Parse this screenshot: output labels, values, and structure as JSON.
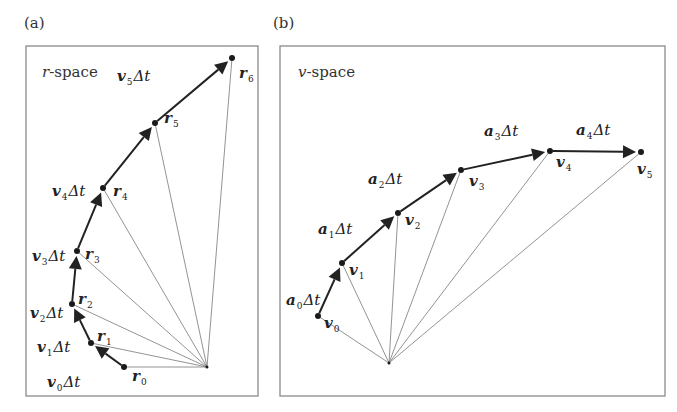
{
  "panels": [
    {
      "id": "a",
      "label": "(a)",
      "space_label_var": "r",
      "space_label_rest": "-space",
      "point_symbol": "r",
      "step_symbol": "v",
      "step_suffix": "Δt",
      "points": [
        {
          "name": "r",
          "index": "0"
        },
        {
          "name": "r",
          "index": "1"
        },
        {
          "name": "r",
          "index": "2"
        },
        {
          "name": "r",
          "index": "3"
        },
        {
          "name": "r",
          "index": "4"
        },
        {
          "name": "r",
          "index": "5"
        },
        {
          "name": "r",
          "index": "6"
        }
      ],
      "steps": [
        {
          "name": "v",
          "index": "0",
          "suffix": "Δt"
        },
        {
          "name": "v",
          "index": "1",
          "suffix": "Δt"
        },
        {
          "name": "v",
          "index": "2",
          "suffix": "Δt"
        },
        {
          "name": "v",
          "index": "3",
          "suffix": "Δt"
        },
        {
          "name": "v",
          "index": "4",
          "suffix": "Δt"
        },
        {
          "name": "v",
          "index": "5",
          "suffix": "Δt"
        }
      ]
    },
    {
      "id": "b",
      "label": "(b)",
      "space_label_var": "v",
      "space_label_rest": "-space",
      "point_symbol": "v",
      "step_symbol": "a",
      "step_suffix": "Δt",
      "points": [
        {
          "name": "v",
          "index": "0"
        },
        {
          "name": "v",
          "index": "1"
        },
        {
          "name": "v",
          "index": "2"
        },
        {
          "name": "v",
          "index": "3"
        },
        {
          "name": "v",
          "index": "4"
        },
        {
          "name": "v",
          "index": "5"
        }
      ],
      "steps": [
        {
          "name": "a",
          "index": "0",
          "suffix": "Δt"
        },
        {
          "name": "a",
          "index": "1",
          "suffix": "Δt"
        },
        {
          "name": "a",
          "index": "2",
          "suffix": "Δt"
        },
        {
          "name": "a",
          "index": "3",
          "suffix": "Δt"
        },
        {
          "name": "a",
          "index": "4",
          "suffix": "Δt"
        }
      ]
    }
  ]
}
